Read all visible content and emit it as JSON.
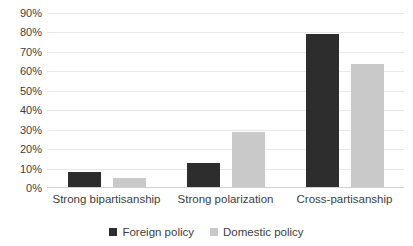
{
  "chart_data": {
    "type": "bar",
    "title": "",
    "xlabel": "",
    "ylabel": "",
    "categories": [
      "Strong bipartisanship",
      "Strong polarization",
      "Cross-partisanship"
    ],
    "series": [
      {
        "name": "Foreign policy",
        "color": "#2d2d2d",
        "values": [
          8,
          13,
          79
        ]
      },
      {
        "name": "Domestic policy",
        "color": "#c9c9c9",
        "values": [
          5,
          29,
          64
        ]
      }
    ],
    "ylim": [
      0,
      90
    ],
    "ytick_values": [
      0,
      10,
      20,
      30,
      40,
      50,
      60,
      70,
      80,
      90
    ],
    "ytick_labels": [
      "0%",
      "10%",
      "20%",
      "30%",
      "40%",
      "50%",
      "60%",
      "70%",
      "80%",
      "90%"
    ],
    "grid": true,
    "legend_position": "bottom",
    "annotations": []
  }
}
